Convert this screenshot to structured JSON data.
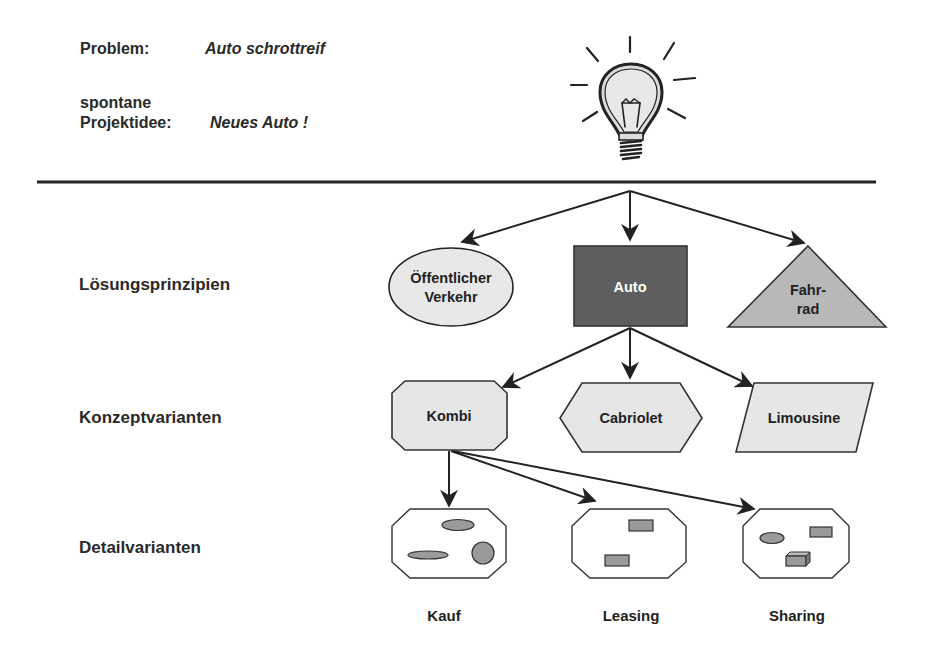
{
  "header": {
    "problem_label": "Problem:",
    "problem_value": "Auto schrottreif",
    "idea_label_line1": "spontane",
    "idea_label_line2": "Projektidee:",
    "idea_value": "Neues Auto !",
    "icon": "lightbulb-icon"
  },
  "levels": {
    "loesungsprinzipien": "Lösungsprinzipien",
    "konzeptvarianten": "Konzeptvarianten",
    "detailvarianten": "Detailvarianten"
  },
  "principles": [
    {
      "shape": "ellipse",
      "line1": "Öffentlicher",
      "line2": "Verkehr"
    },
    {
      "shape": "rectangle",
      "label": "Auto",
      "highlighted": true
    },
    {
      "shape": "triangle",
      "line1": "Fahr-",
      "line2": "rad"
    }
  ],
  "concepts": [
    {
      "shape": "octagon",
      "label": "Kombi",
      "highlighted": true
    },
    {
      "shape": "hexagon",
      "label": "Cabriolet"
    },
    {
      "shape": "parallelogram",
      "label": "Limousine"
    }
  ],
  "details": [
    {
      "label": "Kauf"
    },
    {
      "label": "Leasing"
    },
    {
      "label": "Sharing"
    }
  ],
  "colors": {
    "line": "#222222",
    "light_fill": "#e6e6e6",
    "mid_fill": "#b8b8b8",
    "dark_fill": "#5e5e5e",
    "inner_shape_fill": "#9a9a9a",
    "highlight_text": "#ffffff"
  }
}
